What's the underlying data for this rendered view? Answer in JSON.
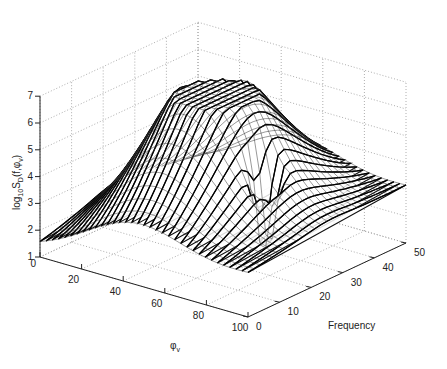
{
  "chart_data": {
    "type": "surface3d",
    "title": "",
    "xlabel": "φ_v",
    "ylabel": "Frequency",
    "zlabel": "log10 S_D(f, φ_v)",
    "x_ticks": [
      0,
      20,
      40,
      60,
      80,
      100
    ],
    "y_ticks": [
      0,
      10,
      20,
      30,
      40,
      50
    ],
    "z_ticks": [
      1,
      2,
      3,
      4,
      5,
      6,
      7
    ],
    "xlim": [
      0,
      100
    ],
    "ylim": [
      0,
      50
    ],
    "zlim": [
      1,
      7
    ],
    "grid": true,
    "style": "black wireframe mesh (waterfall), white background",
    "surface_description": "Peaked ridge; log10 PSD rises from ~1.4 at low phi / edges to ~6.6 peak near phi≈40-50, frequency≈25; sharp narrow dip to ~1.3 near phi≈75, frequency≈22",
    "sample_points": [
      {
        "phi": 0,
        "freq": 0,
        "z": 1.4
      },
      {
        "phi": 0,
        "freq": 50,
        "z": 1.8
      },
      {
        "phi": 45,
        "freq": 25,
        "z": 6.6
      },
      {
        "phi": 75,
        "freq": 22,
        "z": 1.3
      },
      {
        "phi": 100,
        "freq": 50,
        "z": 3.0
      },
      {
        "phi": 100,
        "freq": 0,
        "z": 2.0
      }
    ]
  },
  "axes": {
    "x_label": "φ",
    "x_label_sub": "v",
    "y_label": "Frequency",
    "z_label_main": "log",
    "z_label_sub1": "10",
    "z_label_mid": "S",
    "z_label_sub2": "D",
    "z_label_end": "(f,φ",
    "z_label_sub3": "v",
    "z_label_close": ")"
  }
}
